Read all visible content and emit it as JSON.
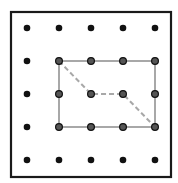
{
  "diagram": {
    "type": "geoboard",
    "grid": {
      "cols": 5,
      "rows": 5
    },
    "frame": {
      "x": 11,
      "y": 12,
      "width": 160,
      "height": 165,
      "stroke": "#1a1a1a"
    },
    "peg_x": [
      27,
      59,
      91,
      123,
      155
    ],
    "peg_y": [
      28,
      61,
      94,
      127,
      160
    ],
    "peg_color": "#111111",
    "rectangle": {
      "from": [
        1,
        1
      ],
      "to": [
        4,
        3
      ],
      "stroke": "#a8a8a8"
    },
    "dashed_path": {
      "points": [
        [
          1,
          1
        ],
        [
          2,
          2
        ],
        [
          3,
          2
        ],
        [
          4,
          3
        ]
      ],
      "stroke": "#a8a8a8"
    }
  }
}
